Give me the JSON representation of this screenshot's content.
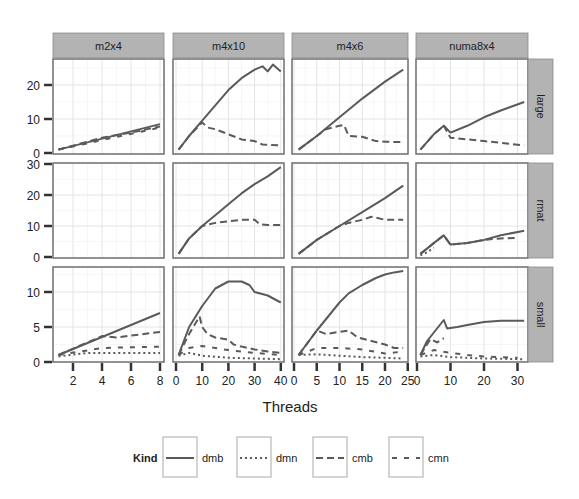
{
  "chart_data": {
    "type": "line",
    "title": "",
    "xlabel": "Threads",
    "ylabel": "",
    "facet_columns": [
      "m2x4",
      "m4x10",
      "m4x6",
      "numa8x4"
    ],
    "facet_rows": [
      "large",
      "rmat",
      "small"
    ],
    "legend": {
      "title": "Kind",
      "position": "bottom",
      "entries": [
        {
          "name": "dmb",
          "style": "solid"
        },
        {
          "name": "dmn",
          "style": "dotted"
        },
        {
          "name": "cmb",
          "style": "dashed"
        },
        {
          "name": "cmn",
          "style": "longdash"
        }
      ]
    },
    "x_axes": {
      "m2x4": {
        "range": [
          1,
          8
        ],
        "ticks": [
          2,
          4,
          6,
          8
        ],
        "tick_labels": [
          "2",
          "4",
          "6",
          "8"
        ]
      },
      "m4x10": {
        "range": [
          0,
          40
        ],
        "ticks": [
          0,
          10,
          20,
          30,
          40
        ],
        "tick_labels": [
          "0",
          "10",
          "20",
          "30",
          "40"
        ]
      },
      "m4x6": {
        "range": [
          0,
          24
        ],
        "ticks": [
          0,
          5,
          10,
          15,
          20,
          25
        ],
        "tick_labels": [
          "0",
          "5",
          "10",
          "15",
          "20",
          "25"
        ]
      },
      "numa8x4": {
        "range": [
          0,
          32
        ],
        "ticks": [
          0,
          10,
          20,
          30
        ],
        "tick_labels": [
          "0",
          "10",
          "20",
          "30"
        ]
      }
    },
    "y_axes": {
      "large": {
        "range": [
          0,
          27
        ],
        "ticks": [
          0,
          10,
          20
        ],
        "tick_labels": [
          "0",
          "10",
          "20"
        ]
      },
      "rmat": {
        "range": [
          0,
          30
        ],
        "ticks": [
          0,
          10,
          20,
          30
        ],
        "tick_labels": [
          "0",
          "10",
          "20",
          "30"
        ]
      },
      "small": {
        "range": [
          0,
          13
        ],
        "ticks": [
          0,
          5,
          10
        ],
        "tick_labels": [
          "0",
          "5",
          "10"
        ]
      }
    },
    "grid": true,
    "panels": [
      {
        "row": "large",
        "col": "m2x4",
        "series": [
          {
            "name": "dmb",
            "x": [
              1,
              8
            ],
            "y": [
              1,
              8.5
            ]
          },
          {
            "name": "cmb",
            "x": [
              1,
              4,
              6,
              8
            ],
            "y": [
              1,
              4.5,
              6,
              7.8
            ]
          },
          {
            "name": "cmn",
            "x": [
              1,
              8
            ],
            "y": [
              1,
              7.5
            ]
          }
        ]
      },
      {
        "row": "large",
        "col": "m4x10",
        "series": [
          {
            "name": "dmb",
            "x": [
              1,
              5,
              10,
              15,
              20,
              25,
              30,
              33,
              35,
              37,
              40
            ],
            "y": [
              1,
              5,
              9.5,
              14,
              18.5,
              22,
              24.5,
              25.5,
              24,
              26,
              24
            ]
          },
          {
            "name": "cmb",
            "x": [
              1,
              5,
              10,
              12,
              15,
              20,
              25,
              30,
              33,
              40
            ],
            "y": [
              1,
              5,
              9,
              7.5,
              7,
              5.5,
              4,
              3.5,
              2.5,
              2.2
            ]
          }
        ]
      },
      {
        "row": "large",
        "col": "m4x6",
        "series": [
          {
            "name": "dmb",
            "x": [
              1,
              5,
              10,
              15,
              20,
              24
            ],
            "y": [
              1,
              5,
              10.5,
              16,
              21,
              24.5
            ]
          },
          {
            "name": "cmb",
            "x": [
              1,
              5,
              7,
              10,
              11,
              12,
              15,
              18,
              20,
              24
            ],
            "y": [
              1,
              5,
              7,
              8,
              8.2,
              5,
              4.8,
              3.5,
              3.3,
              3.2
            ]
          }
        ]
      },
      {
        "row": "large",
        "col": "numa8x4",
        "series": [
          {
            "name": "dmb",
            "x": [
              1,
              5,
              8,
              10,
              15,
              20,
              25,
              32
            ],
            "y": [
              1,
              5.5,
              8,
              6,
              8,
              10.5,
              12.5,
              15
            ]
          },
          {
            "name": "cmb",
            "x": [
              1,
              5,
              8,
              10,
              15,
              20,
              25,
              32
            ],
            "y": [
              1,
              5.5,
              8,
              4.5,
              4,
              3.5,
              3,
              2.2
            ]
          }
        ]
      },
      {
        "row": "rmat",
        "col": "m2x4",
        "series": []
      },
      {
        "row": "rmat",
        "col": "m4x10",
        "series": [
          {
            "name": "dmb",
            "x": [
              1,
              5,
              10,
              15,
              20,
              25,
              30,
              35,
              40
            ],
            "y": [
              1,
              6,
              10,
              13.5,
              17,
              20.5,
              23.5,
              26,
              29
            ]
          },
          {
            "name": "cmb",
            "x": [
              1,
              5,
              10,
              15,
              20,
              25,
              30,
              32,
              35,
              40
            ],
            "y": [
              1,
              6,
              10,
              11,
              11.5,
              12,
              12,
              10.5,
              10.3,
              10.3
            ]
          }
        ]
      },
      {
        "row": "rmat",
        "col": "m4x6",
        "series": [
          {
            "name": "dmb",
            "x": [
              1,
              5,
              10,
              15,
              20,
              24
            ],
            "y": [
              1,
              5.5,
              10,
              14.5,
              19,
              23
            ]
          },
          {
            "name": "cmb",
            "x": [
              1,
              5,
              10,
              12,
              15,
              17,
              20,
              24
            ],
            "y": [
              1,
              5.5,
              10,
              11,
              12,
              13,
              12,
              12
            ]
          }
        ]
      },
      {
        "row": "rmat",
        "col": "numa8x4",
        "series": [
          {
            "name": "dmb",
            "x": [
              1,
              5,
              8,
              10,
              15,
              20,
              25,
              32
            ],
            "y": [
              1,
              4.5,
              7,
              4,
              4.5,
              5.5,
              7,
              8.5
            ]
          },
          {
            "name": "cmb",
            "x": [
              1,
              5,
              8,
              10,
              15,
              20,
              25,
              30
            ],
            "y": [
              1,
              4.5,
              7,
              4,
              4.5,
              5.5,
              6,
              6.2
            ]
          },
          {
            "name": "dmn",
            "x": [
              1,
              3,
              5
            ],
            "y": [
              0.5,
              1.5,
              3
            ]
          }
        ]
      },
      {
        "row": "small",
        "col": "m2x4",
        "series": [
          {
            "name": "dmb",
            "x": [
              1,
              8
            ],
            "y": [
              1,
              7
            ]
          },
          {
            "name": "cmb",
            "x": [
              1,
              4,
              5,
              8
            ],
            "y": [
              1,
              3.7,
              3.5,
              4.3
            ]
          },
          {
            "name": "cmn",
            "x": [
              1,
              4,
              8
            ],
            "y": [
              1,
              2,
              2.2
            ]
          },
          {
            "name": "dmn",
            "x": [
              1,
              3,
              8
            ],
            "y": [
              0.8,
              1.3,
              1.3
            ]
          }
        ]
      },
      {
        "row": "small",
        "col": "m4x10",
        "series": [
          {
            "name": "dmb",
            "x": [
              1,
              5,
              10,
              15,
              20,
              25,
              28,
              30,
              35,
              40
            ],
            "y": [
              1,
              5,
              8,
              10.5,
              11.5,
              11.5,
              11,
              10,
              9.5,
              8.5
            ]
          },
          {
            "name": "cmb",
            "x": [
              1,
              5,
              9,
              10,
              12,
              15,
              20,
              22,
              25,
              30,
              35,
              40
            ],
            "y": [
              1,
              4,
              6.5,
              5,
              4,
              3.5,
              3.2,
              2.5,
              2.2,
              1.8,
              1.5,
              1.3
            ]
          },
          {
            "name": "cmn",
            "x": [
              1,
              5,
              10,
              15,
              20,
              25,
              30,
              40
            ],
            "y": [
              1,
              2,
              2.3,
              2,
              1.7,
              1.5,
              1.3,
              1
            ]
          },
          {
            "name": "dmn",
            "x": [
              1,
              5,
              10,
              20,
              30,
              40
            ],
            "y": [
              0.9,
              1.3,
              0.9,
              0.6,
              0.5,
              0.4
            ]
          }
        ]
      },
      {
        "row": "small",
        "col": "m4x6",
        "series": [
          {
            "name": "dmb",
            "x": [
              1,
              5,
              10,
              12,
              15,
              18,
              20,
              22,
              24
            ],
            "y": [
              1,
              4.5,
              8.5,
              9.8,
              11,
              12,
              12.5,
              12.8,
              13
            ]
          },
          {
            "name": "cmb",
            "x": [
              1,
              5,
              7,
              10,
              12,
              14,
              17,
              20,
              22,
              24
            ],
            "y": [
              1,
              4.5,
              4,
              4.3,
              4.5,
              3.5,
              3,
              2.5,
              2,
              2
            ]
          },
          {
            "name": "cmn",
            "x": [
              1,
              5,
              10,
              15,
              20,
              24
            ],
            "y": [
              1,
              2,
              2,
              1.8,
              1.2,
              1.5
            ]
          },
          {
            "name": "dmn",
            "x": [
              1,
              5,
              10,
              15,
              20,
              24
            ],
            "y": [
              1,
              1.1,
              0.9,
              0.7,
              0.6,
              0.5
            ]
          }
        ]
      },
      {
        "row": "small",
        "col": "numa8x4",
        "series": [
          {
            "name": "dmb",
            "x": [
              1,
              3,
              8,
              9,
              12,
              15,
              20,
              25,
              32
            ],
            "y": [
              1,
              3,
              6,
              4.8,
              5,
              5.3,
              5.7,
              5.9,
              5.9
            ]
          },
          {
            "name": "cmb",
            "x": [
              1,
              4,
              6,
              8
            ],
            "y": [
              1,
              3.3,
              2.8,
              3.4
            ]
          },
          {
            "name": "cmn",
            "x": [
              1,
              5,
              10,
              15,
              20,
              25,
              30
            ],
            "y": [
              1,
              1.7,
              1.3,
              1.0,
              0.8,
              0.7,
              0.6
            ]
          },
          {
            "name": "dmn",
            "x": [
              1,
              5,
              10,
              20,
              32
            ],
            "y": [
              0.8,
              1.0,
              0.7,
              0.5,
              0.4
            ]
          }
        ]
      }
    ]
  }
}
